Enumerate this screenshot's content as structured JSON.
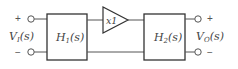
{
  "diagram": {
    "type": "block-diagram",
    "input": {
      "label_main": "V",
      "label_sub": "I",
      "label_arg": "(s)",
      "plus": "+",
      "minus": "−"
    },
    "blocks": [
      {
        "id": "h1",
        "label_main": "H",
        "label_sub": "1",
        "label_arg": "(s)"
      },
      {
        "id": "buffer",
        "label": "x1"
      },
      {
        "id": "h2",
        "label_main": "H",
        "label_sub": "2",
        "label_arg": "(s)"
      }
    ],
    "output": {
      "label_main": "V",
      "label_sub": "O",
      "label_arg": "(s)",
      "plus": "+",
      "minus": "−"
    },
    "colors": {
      "stroke": "#333333",
      "text": "#444444",
      "background": "#ffffff"
    }
  }
}
